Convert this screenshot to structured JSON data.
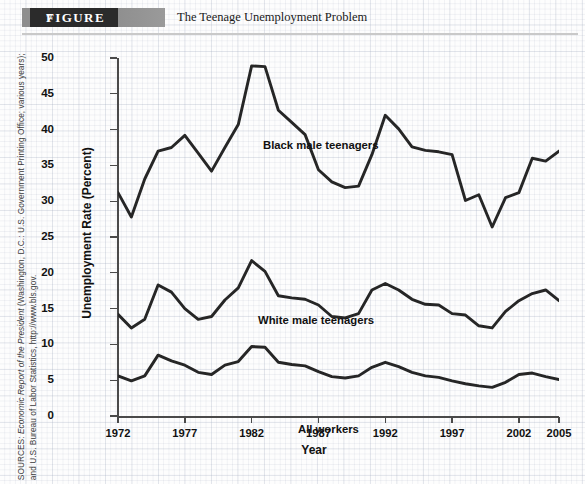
{
  "figure": {
    "badge_word": "FIGURE",
    "number": "7",
    "title": "The Teenage Unemployment Problem"
  },
  "source_note": "SOURCES: Economic Report of the President (Washington, D.C.: U.S. Government Printing Office; various years); and U.S. Bureau of Labor Statistics, http://www.bls.gov.",
  "source_italic_part": "Economic Report of the President",
  "colors": {
    "line": "#262626",
    "axis": "#4a4a4a",
    "badge_dark": "#2b2b2b",
    "badge_gray": "#9a9a9a",
    "paper": "#fdfdfd",
    "grid": "#a0aabe"
  },
  "chart_data": {
    "type": "line",
    "title": "The Teenage Unemployment Problem",
    "xlabel": "Year",
    "ylabel": "Unemployment Rate (Percent)",
    "xlim": [
      1972,
      2005
    ],
    "ylim": [
      0,
      50
    ],
    "ytick_values": [
      0,
      5,
      10,
      15,
      20,
      25,
      30,
      35,
      40,
      45,
      50
    ],
    "ytick_labels": [
      "0",
      "5",
      "10",
      "15",
      "20",
      "25",
      "30",
      "35",
      "40",
      "45",
      "50"
    ],
    "xtick_values": [
      1972,
      1977,
      1982,
      1987,
      1992,
      1997,
      2002,
      2005
    ],
    "xtick_labels": [
      "1972",
      "1977",
      "1982",
      "1987",
      "1992",
      "1997",
      "2002",
      "2005"
    ],
    "grid": false,
    "legend_position": "inline-annotations",
    "x": [
      1972,
      1973,
      1974,
      1975,
      1976,
      1977,
      1978,
      1979,
      1980,
      1981,
      1982,
      1983,
      1984,
      1985,
      1986,
      1987,
      1988,
      1989,
      1990,
      1991,
      1992,
      1993,
      1994,
      1995,
      1996,
      1997,
      1998,
      1999,
      2000,
      2001,
      2002,
      2003,
      2004,
      2005
    ],
    "series": [
      {
        "name": "Black male teenagers",
        "label": "Black male teenagers",
        "values": [
          31.2,
          27.8,
          33.1,
          37.0,
          37.5,
          39.2,
          36.7,
          34.2,
          37.5,
          40.7,
          48.9,
          48.8,
          42.7,
          41.0,
          39.3,
          34.4,
          32.7,
          31.9,
          32.1,
          36.5,
          42.0,
          40.1,
          37.6,
          37.1,
          36.9,
          36.5,
          30.1,
          30.9,
          26.4,
          30.5,
          31.2,
          36.0,
          35.6,
          37.0
        ]
      },
      {
        "name": "White male teenagers",
        "label": "White male teenagers",
        "values": [
          14.2,
          12.3,
          13.5,
          18.3,
          17.3,
          15.0,
          13.5,
          13.9,
          16.2,
          17.9,
          21.7,
          20.2,
          16.8,
          16.5,
          16.3,
          15.5,
          13.9,
          13.7,
          14.3,
          17.6,
          18.5,
          17.6,
          16.3,
          15.6,
          15.5,
          14.3,
          14.1,
          12.6,
          12.3,
          14.6,
          16.1,
          17.1,
          17.6,
          16.1
        ]
      },
      {
        "name": "All workers",
        "label": "All workers",
        "values": [
          5.6,
          4.9,
          5.6,
          8.5,
          7.7,
          7.1,
          6.1,
          5.8,
          7.1,
          7.6,
          9.7,
          9.6,
          7.5,
          7.2,
          7.0,
          6.2,
          5.5,
          5.3,
          5.6,
          6.8,
          7.5,
          6.9,
          6.1,
          5.6,
          5.4,
          4.9,
          4.5,
          4.2,
          4.0,
          4.7,
          5.8,
          6.0,
          5.5,
          5.1
        ]
      }
    ]
  }
}
